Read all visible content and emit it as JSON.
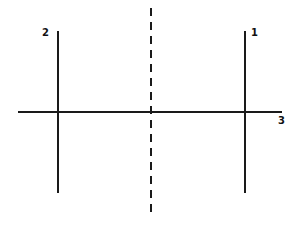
{
  "diagram": {
    "colors": {
      "line": "#1a1a1a",
      "background": "#ffffff"
    },
    "horizontal_axis": {
      "x1": 18,
      "x2": 282,
      "y": 112,
      "label": "3"
    },
    "center_line": {
      "x": 151,
      "y1": 8,
      "y2": 216,
      "style": "dashed"
    },
    "vertical_lines": [
      {
        "id": "2",
        "label": "2",
        "x": 58,
        "y1": 31,
        "y2": 193
      },
      {
        "id": "1",
        "label": "1",
        "x": 245,
        "y1": 31,
        "y2": 193
      }
    ]
  }
}
